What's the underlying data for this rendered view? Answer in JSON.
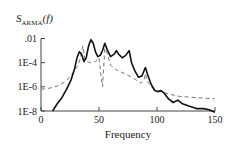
{
  "chart_data": {
    "type": "line",
    "title": "",
    "ylabel_main": "S",
    "ylabel_sub": "ARMA",
    "ylabel_arg": "(f)",
    "xlabel": "Frequency",
    "yscale": "log",
    "xlim": [
      0,
      150
    ],
    "ylim": [
      1e-08,
      0.01
    ],
    "x_ticks": [
      "0",
      "50",
      "100",
      "150"
    ],
    "y_ticks": [
      ".01",
      "1E-4",
      "1E-6",
      "1E-8"
    ],
    "grid": false,
    "legend": null,
    "series": [
      {
        "name": "ARMA spectrum (solid)",
        "style": "solid",
        "points_log10": [
          [
            10,
            -8.0
          ],
          [
            14,
            -7.4
          ],
          [
            18,
            -6.9
          ],
          [
            22,
            -6.2
          ],
          [
            26,
            -5.4
          ],
          [
            29,
            -4.5
          ],
          [
            31,
            -3.6
          ],
          [
            33,
            -3.1
          ],
          [
            35,
            -3.3
          ],
          [
            37,
            -3.9
          ],
          [
            39,
            -3.6
          ],
          [
            41,
            -2.6
          ],
          [
            43,
            -2.1
          ],
          [
            45,
            -2.4
          ],
          [
            47,
            -3.1
          ],
          [
            49,
            -3.5
          ],
          [
            51,
            -3.4
          ],
          [
            53,
            -3.0
          ],
          [
            55,
            -2.4
          ],
          [
            57,
            -2.9
          ],
          [
            60,
            -3.5
          ],
          [
            63,
            -3.3
          ],
          [
            65,
            -3.0
          ],
          [
            67,
            -3.3
          ],
          [
            70,
            -3.6
          ],
          [
            73,
            -3.4
          ],
          [
            76,
            -3.0
          ],
          [
            78,
            -4.0
          ],
          [
            81,
            -4.7
          ],
          [
            84,
            -5.2
          ],
          [
            87,
            -5.1
          ],
          [
            90,
            -4.4
          ],
          [
            92,
            -5.0
          ],
          [
            95,
            -5.8
          ],
          [
            98,
            -6.3
          ],
          [
            101,
            -6.4
          ],
          [
            103,
            -6.3
          ],
          [
            106,
            -6.5
          ],
          [
            110,
            -7.0
          ],
          [
            114,
            -7.3
          ],
          [
            118,
            -7.1
          ],
          [
            122,
            -7.4
          ],
          [
            128,
            -7.6
          ],
          [
            134,
            -7.8
          ],
          [
            140,
            -7.8
          ],
          [
            145,
            -7.9
          ],
          [
            150,
            -8.1
          ]
        ]
      },
      {
        "name": "Reference spectrum (dashed)",
        "style": "dashed",
        "points_log10": [
          [
            0,
            -6.2
          ],
          [
            8,
            -6.1
          ],
          [
            15,
            -5.9
          ],
          [
            22,
            -5.5
          ],
          [
            28,
            -4.8
          ],
          [
            32,
            -4.2
          ],
          [
            34,
            -3.6
          ],
          [
            36,
            -2.6
          ],
          [
            38,
            -3.8
          ],
          [
            42,
            -4.0
          ],
          [
            47,
            -3.9
          ],
          [
            50,
            -3.6
          ],
          [
            52,
            -5.3
          ],
          [
            53,
            -6.0
          ],
          [
            54,
            -4.5
          ],
          [
            55,
            -2.8
          ],
          [
            57,
            -3.2
          ],
          [
            60,
            -4.2
          ],
          [
            65,
            -4.6
          ],
          [
            72,
            -4.9
          ],
          [
            80,
            -5.3
          ],
          [
            86,
            -5.7
          ],
          [
            89,
            -5.4
          ],
          [
            90,
            -4.9
          ],
          [
            92,
            -5.6
          ],
          [
            96,
            -6.1
          ],
          [
            100,
            -6.3
          ],
          [
            110,
            -6.6
          ],
          [
            120,
            -6.8
          ],
          [
            135,
            -6.9
          ],
          [
            150,
            -7.0
          ]
        ]
      }
    ]
  },
  "colors": {
    "solid_line": "#111111",
    "dashed_line": "#777777",
    "axis": "#444444",
    "text": "#222222"
  }
}
